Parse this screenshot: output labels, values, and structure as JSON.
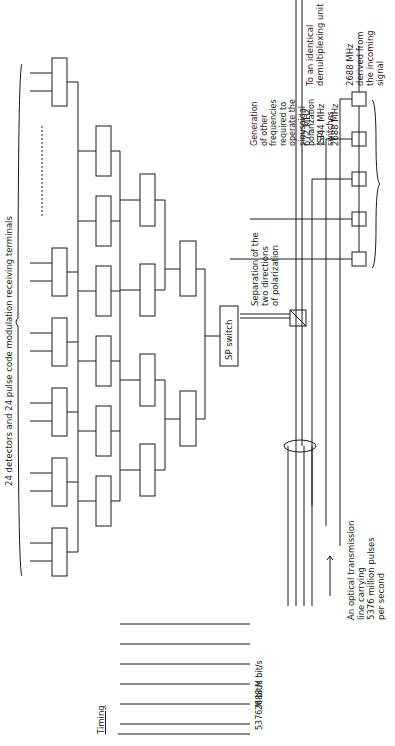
{
  "figure": {
    "orientation": "rotated-90-ccw",
    "timing": {
      "title": "Timing",
      "rows": [
        {
          "label": "Multiplexed\nbeam",
          "rate": "5376 M bit/s",
          "pulses": 24
        },
        {
          "label": "Output\nof first\nstage",
          "rate": "2688 M bit/s",
          "pulses": 12
        },
        {
          "label": "Output\nof second\nstage",
          "rate": "1344 M bit/s",
          "pulses": 6
        },
        {
          "label": "Output\nof third\nstage",
          "rate": "672 M bit/s",
          "pulses": 3
        },
        {
          "label": "Output\nof fourth\nstage",
          "rate": "448 M bit/s",
          "pulses": 2
        },
        {
          "label": "Output\nof fifth\nstage",
          "rate": "224 M bit/s",
          "pulses": 1
        }
      ]
    },
    "optical_line_label": "An optical transmission\nline carrying\n5376 million pulses\nper second",
    "polarization_label": "Separation of the\ntwo directions\nof polarization",
    "output_label": "To an identical\ndemultiplexing unit",
    "clock_label": "2688 MHz\nderived from\nthe incoming\nsignal",
    "generation_label": "Generation\nof other\nfrequencies\nrequired to\noperate the\nsinusoidal\npolarization\n(SP)\nswitches",
    "frequencies": [
      "2688 MHz",
      "1344 MHz",
      "672 MHz"
    ],
    "switch_label": "SP switch",
    "terminals_label": "24 detectors and 24 pulse code modulation receiving terminals"
  }
}
